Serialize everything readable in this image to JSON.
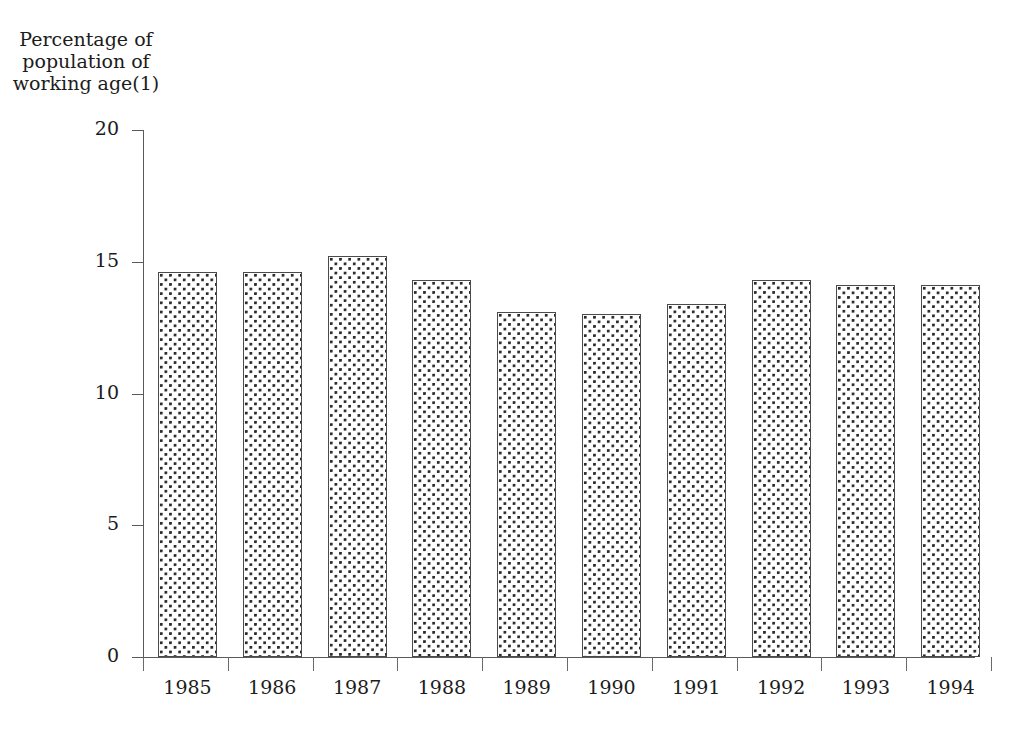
{
  "chart_data": {
    "type": "bar",
    "title": "Percentage of population of working age(1)",
    "title_lines": [
      "Percentage of",
      "population of",
      "working age(1)"
    ],
    "xlabel": "",
    "ylabel": "Percentage of population of working age(1)",
    "categories": [
      "1985",
      "1986",
      "1987",
      "1988",
      "1989",
      "1990",
      "1991",
      "1992",
      "1993",
      "1994"
    ],
    "values": [
      14.6,
      14.6,
      15.2,
      14.3,
      13.1,
      13.0,
      13.4,
      14.3,
      14.1,
      14.1
    ],
    "ylim": [
      0,
      20
    ],
    "yticks": [
      0,
      5,
      10,
      15,
      20
    ],
    "ytick_labels": [
      "0",
      "5",
      "10",
      "15",
      "20"
    ],
    "grid": false,
    "legend": "none",
    "bar_fill": "dotted-pattern",
    "bar_fill_color": "#2b2b2b",
    "bar_border_color": "#4a4a4a",
    "bar_background_color": "#ffffff",
    "axis_color": "#5a5a5a",
    "text_color": "#1c1c1c",
    "page_background": "#ffffff"
  }
}
